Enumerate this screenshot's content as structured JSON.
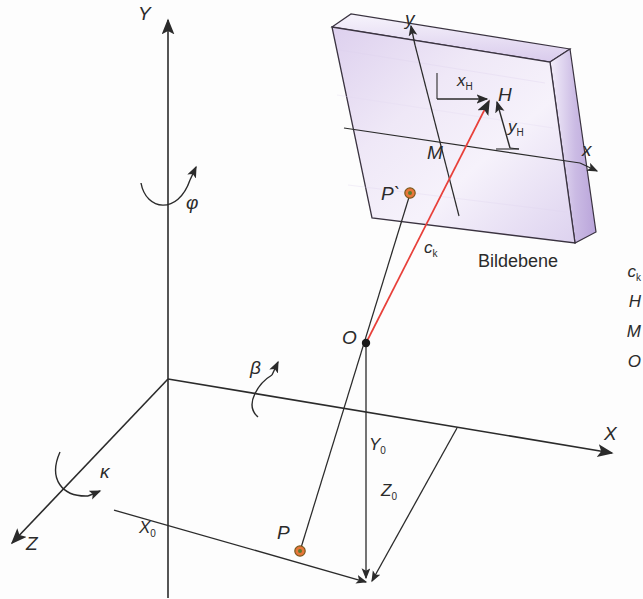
{
  "figure": {
    "plane_label": "Bildebene",
    "background_color": "#fdfdfd",
    "plane_fill": "#e9e0f2",
    "plane_edge_fill": "#c6b6df",
    "ray_color": "#e8403a",
    "line_color": "#2b2b2b",
    "point_color": "#e8763a"
  },
  "axes": [
    {
      "name": "Y",
      "label": "Y"
    },
    {
      "name": "X",
      "label": "X"
    },
    {
      "name": "Z",
      "label": "Z"
    }
  ],
  "rotations": [
    {
      "name": "phi",
      "label": "φ",
      "about": "Y"
    },
    {
      "name": "beta",
      "label": "β",
      "about": "X"
    },
    {
      "name": "kappa",
      "label": "κ",
      "about": "Z"
    }
  ],
  "image_axes": [
    {
      "name": "y",
      "label": "y"
    },
    {
      "name": "x",
      "label": "x"
    }
  ],
  "points": [
    {
      "name": "H",
      "label": "H",
      "desc": "principal point"
    },
    {
      "name": "M",
      "label": "M",
      "desc": "image centre"
    },
    {
      "name": "P-prime",
      "label": "P`",
      "desc": "image point"
    },
    {
      "name": "O",
      "label": "O",
      "desc": "projection centre"
    },
    {
      "name": "P",
      "label": "P",
      "desc": "object point"
    }
  ],
  "measures": [
    {
      "name": "x_H",
      "label": "x",
      "sub": "H"
    },
    {
      "name": "y_H",
      "label": "y",
      "sub": "H"
    },
    {
      "name": "c_k",
      "label": "c",
      "sub": "k"
    },
    {
      "name": "X_0",
      "label": "X",
      "sub": "0"
    },
    {
      "name": "Y_0",
      "label": "Y",
      "sub": "0"
    },
    {
      "name": "Z_0",
      "label": "Z",
      "sub": "0"
    }
  ],
  "legend": {
    "items": [
      {
        "label": "c",
        "sub": "k"
      },
      {
        "label": "H",
        "sub": ""
      },
      {
        "label": "M",
        "sub": ""
      },
      {
        "label": "O",
        "sub": ""
      }
    ]
  }
}
